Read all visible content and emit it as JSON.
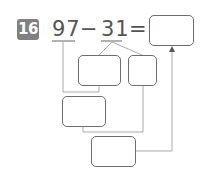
{
  "problem": {
    "number": "16",
    "minuend": "97",
    "operator": "−",
    "subtrahend": "31",
    "equals": "="
  },
  "boxes": {
    "answer": "",
    "split_tens": "",
    "split_ones": "",
    "intermediate": "",
    "final": ""
  },
  "colors": {
    "badge": "#808080",
    "text": "#555555",
    "box_border": "#6e6e6e",
    "lines": "#aaaaaa"
  }
}
